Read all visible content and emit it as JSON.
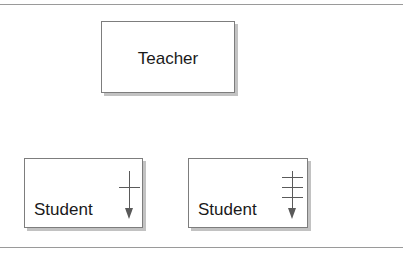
{
  "page": {
    "background": "#ffffff",
    "width": 403,
    "height": 254,
    "top_rule_color": "#9a9a9a",
    "bottom_rule_color": "#9a9a9a"
  },
  "diagram": {
    "type": "entity-relationship-crowsfoot",
    "nodes": [
      {
        "id": "teacher",
        "label": "Teacher",
        "align": "center",
        "has_arrow": false
      },
      {
        "id": "student-1",
        "label": "Student",
        "align": "left",
        "has_arrow": true,
        "arrow_icon": "down-arrow-one-crossbar",
        "crossbars": 1
      },
      {
        "id": "student-2",
        "label": "Student",
        "align": "left",
        "has_arrow": true,
        "arrow_icon": "down-arrow-three-crossbars",
        "crossbars": 3
      }
    ],
    "colors": {
      "box_border": "#7d7d7d",
      "box_fill": "#ffffff",
      "box_shadow": "#c2c2c2",
      "text": "#1a1a1a",
      "arrow": "#5a5a5a"
    }
  }
}
